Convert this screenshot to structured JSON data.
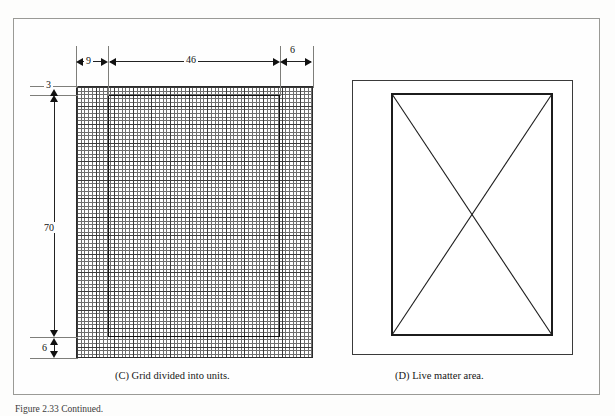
{
  "figure": {
    "caption": "Figure 2.33  Continued."
  },
  "panels": [
    {
      "id": "C",
      "caption": "(C) Grid divided into units.",
      "dimensions": {
        "horizontal": [
          {
            "label": "9",
            "name": "left-margin"
          },
          {
            "label": "46",
            "name": "live-width"
          },
          {
            "label": "6",
            "name": "right-margin"
          }
        ],
        "vertical": [
          {
            "label": "3",
            "name": "head-margin"
          },
          {
            "label": "70",
            "name": "live-height"
          },
          {
            "label": "6",
            "name": "foot-margin"
          }
        ]
      }
    },
    {
      "id": "D",
      "caption": "(D) Live matter area."
    }
  ],
  "colors": {
    "page_border": "#9a9a96",
    "rule": "#222222",
    "grid_fine": "#6e6e6e",
    "grid_heavy": "#3a3a3a",
    "ink": "#111111",
    "background": "#fdfdfc"
  }
}
